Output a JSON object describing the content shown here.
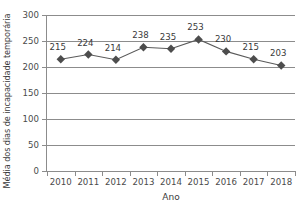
{
  "chart_data": {
    "type": "line",
    "title": "",
    "xlabel": "Ano",
    "ylabel": "Média dos dias de incapacidade temporária",
    "categories": [
      "2010",
      "2011",
      "2012",
      "2013",
      "2014",
      "2015",
      "2016",
      "2017",
      "2018"
    ],
    "values": [
      215,
      224,
      214,
      238,
      235,
      253,
      230,
      215,
      203
    ],
    "data_labels": [
      "215",
      "224",
      "214",
      "238",
      "235",
      "253",
      "230",
      "215",
      "203"
    ],
    "ylim": [
      0,
      300
    ],
    "ytick_labels": [
      "0",
      "50",
      "100",
      "150",
      "200",
      "250",
      "300"
    ],
    "ytick_values": [
      0,
      50,
      100,
      150,
      200,
      250,
      300
    ],
    "grid": true,
    "grid_axis": "y",
    "legend": false,
    "marker": "diamond",
    "colors": {
      "line": "#5a5a5a",
      "marker": "#4d4d4d",
      "grid": "#8c8c8c",
      "axis": "#8c8c8c",
      "text": "#3a3a3a",
      "background": "#ffffff"
    }
  }
}
